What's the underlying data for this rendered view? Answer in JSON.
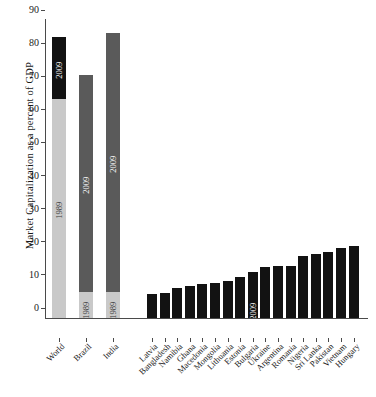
{
  "chart_data": {
    "type": "bar",
    "title": "",
    "xlabel": "",
    "ylabel": "Market Capitalization as a percent of GDP",
    "ylim": [
      0,
      90
    ],
    "yticks": [
      0,
      10,
      20,
      30,
      40,
      50,
      60,
      70,
      80,
      90
    ],
    "grid": false,
    "legend": "none",
    "categories": [
      "World",
      "Brazil",
      "India",
      "Latvia",
      "Bangladesh",
      "Namibia",
      "Ghana",
      "Macedonia",
      "Mongolia",
      "Lithuania",
      "Estonia",
      "Bulgaria",
      "Ukraine",
      "Argentina",
      "Romania",
      "Nigeria",
      "Sri Lanka",
      "Pakistan",
      "Vietnam",
      "Hungary"
    ],
    "series": [
      {
        "name": "1989",
        "values": [
          66,
          8,
          8,
          null,
          null,
          null,
          null,
          null,
          null,
          null,
          null,
          null,
          null,
          null,
          null,
          null,
          null,
          null,
          null,
          null
        ]
      },
      {
        "name": "2009",
        "values": [
          85,
          73.5,
          86,
          7.2,
          7.5,
          9.2,
          9.7,
          10.2,
          10.7,
          11.3,
          12.5,
          13.8,
          15.3,
          15.6,
          15.8,
          18.6,
          19.2,
          19.8,
          21.0,
          21.8
        ]
      }
    ],
    "inbar_labels": [
      {
        "category": "World",
        "text": "2009",
        "tone": "light"
      },
      {
        "category": "World",
        "text": "1989",
        "tone": "dark"
      },
      {
        "category": "Brazil",
        "text": "2009",
        "tone": "light"
      },
      {
        "category": "Brazil",
        "text": "1989",
        "tone": "dark"
      },
      {
        "category": "India",
        "text": "2009",
        "tone": "light"
      },
      {
        "category": "India",
        "text": "1989",
        "tone": "dark"
      },
      {
        "category": "Bulgaria",
        "text": "2009",
        "tone": "light"
      }
    ],
    "colors": {
      "old_segment": "#c9c9c9",
      "new_segment_dark": "#121212",
      "new_segment_mid": "#5a5a5a",
      "axis": "#4a4a4a",
      "background": "#ffffff"
    }
  }
}
